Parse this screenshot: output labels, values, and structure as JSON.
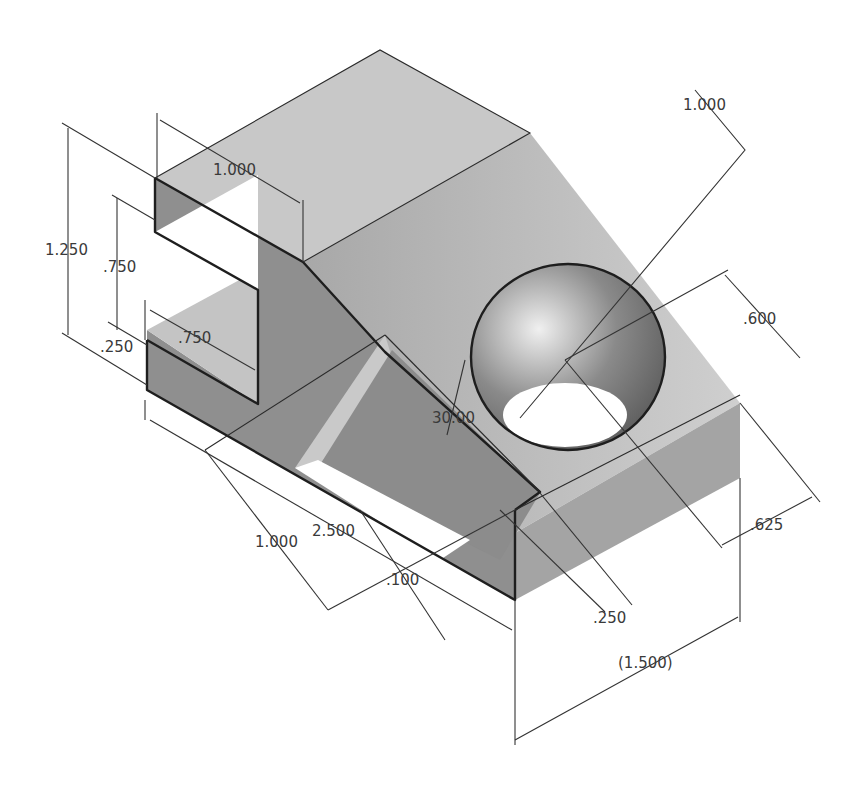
{
  "drawing": {
    "title": "Isometric bracket with slot, triangular cut and through-hole",
    "colors": {
      "background": "#ffffff",
      "face_top": "#c6c6c6",
      "face_left": "#8e8e8e",
      "face_front": "#9e9e9e",
      "edge": "#1e1e1e",
      "dimension": "#333333"
    },
    "dimensions": [
      {
        "id": "overall-height",
        "label": "1.250"
      },
      {
        "id": "slot-height",
        "label": ".750"
      },
      {
        "id": "base-thickness",
        "label": ".250"
      },
      {
        "id": "top-depth",
        "label": "1.000"
      },
      {
        "id": "slot-depth",
        "label": ".750"
      },
      {
        "id": "hole-diameter",
        "label": "1.000"
      },
      {
        "id": "hole-offset-y",
        "label": ".600"
      },
      {
        "id": "angle",
        "label": "30.00"
      },
      {
        "id": "cut-width",
        "label": "1.000"
      },
      {
        "id": "overall-length",
        "label": "2.500"
      },
      {
        "id": "chamfer",
        "label": ".100"
      },
      {
        "id": "rib-width",
        "label": ".250"
      },
      {
        "id": "hole-offset-x",
        "label": ".625"
      },
      {
        "id": "overall-width-ref",
        "label": "(1.500)"
      }
    ]
  }
}
